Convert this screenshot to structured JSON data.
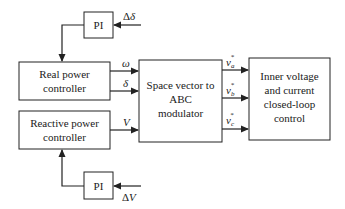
{
  "blocks": {
    "pi_top": {
      "label": "PI"
    },
    "real_power": {
      "lines": [
        "Real power",
        "controller"
      ]
    },
    "reactive_power": {
      "lines": [
        "Reactive power",
        "controller"
      ]
    },
    "pi_bottom": {
      "label": "PI"
    },
    "modulator": {
      "lines": [
        "Space vector to",
        "ABC",
        "modulator"
      ]
    },
    "inner_control": {
      "lines": [
        "Inner voltage",
        "and current",
        "closed-loop",
        "control"
      ]
    }
  },
  "signals": {
    "delta_delta": {
      "prefix": "Δ",
      "symbol": "δ"
    },
    "omega": "ω",
    "delta": "δ",
    "v": "V",
    "delta_v": {
      "prefix": "Δ",
      "symbol": "V"
    },
    "va": {
      "base": "v",
      "sub": "a",
      "sup": "*"
    },
    "vb": {
      "base": "v",
      "sub": "b",
      "sup": "*"
    },
    "vc": {
      "base": "v",
      "sub": "c",
      "sup": "*"
    }
  }
}
